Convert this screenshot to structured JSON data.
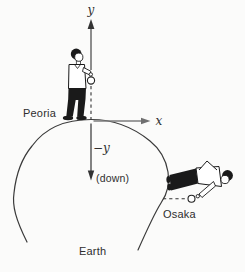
{
  "diagram": {
    "axes": {
      "y_label": "y",
      "x_label": "x",
      "neg_y_label": "−y",
      "down_label": "(down)"
    },
    "labels": {
      "peoria": "Peoria",
      "osaka": "Osaka",
      "earth": "Earth"
    },
    "colors": {
      "background": "#fbfbfa",
      "ink": "#333333",
      "person_fill": "#1a1a1a",
      "x_axis_gray": "#7d7d7d",
      "text": "#2e2e2e"
    }
  }
}
